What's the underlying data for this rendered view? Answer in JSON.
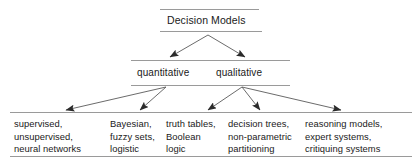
{
  "diagram": {
    "title": "Decision Models",
    "type": "hierarchy-tree",
    "line_color": "#888888",
    "text_color": "#1a1a1a",
    "background": "#ffffff",
    "root": {
      "label": "Decision Models"
    },
    "level2": [
      {
        "label": "quantitative"
      },
      {
        "label": "qualitative"
      }
    ],
    "leaves": [
      {
        "lines": [
          "supervised,",
          "unsupervised,",
          "neural networks"
        ]
      },
      {
        "lines": [
          "Bayesian,",
          "fuzzy sets,",
          "logistic"
        ]
      },
      {
        "lines": [
          "truth tables,",
          "Boolean",
          "logic"
        ]
      },
      {
        "lines": [
          "decision trees,",
          "non-parametric",
          "partitioning"
        ]
      },
      {
        "lines": [
          "reasoning models,",
          "expert systems,",
          "critiquing systems"
        ]
      }
    ]
  }
}
